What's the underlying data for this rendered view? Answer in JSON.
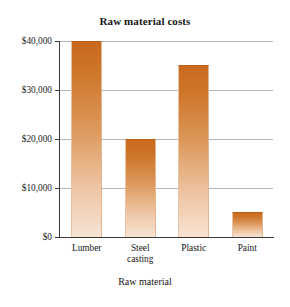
{
  "page": {
    "top_sliver_text": "·· ·             ·   ·"
  },
  "chart_data": {
    "type": "bar",
    "title": "Raw material costs",
    "xlabel": "Raw material",
    "ylabel": "",
    "categories": [
      "Lumber",
      "Steel casting",
      "Plastic",
      "Paint"
    ],
    "category_lines": [
      [
        "Lumber"
      ],
      [
        "Steel",
        "casting"
      ],
      [
        "Plastic"
      ],
      [
        "Paint"
      ]
    ],
    "values": [
      40000,
      20000,
      35000,
      5000
    ],
    "value_labels": [
      "$40,000",
      "$20,000",
      "$35,000",
      "$5,000"
    ],
    "ylim": [
      0,
      40000
    ],
    "ytick_values": [
      40000,
      30000,
      20000,
      10000,
      0
    ],
    "ytick_labels": [
      "$40,000",
      "$30,000",
      "$20,000",
      "$10,000",
      "$0"
    ],
    "grid": true,
    "grid_axis": "y",
    "legend": false,
    "bar_color_top": "#C96A1E",
    "bar_color_bottom": "#F7E3D3",
    "gridline_color": "#B5B5B5",
    "axis_color": "#3A3A3A",
    "background_color": "#FFFFFF"
  }
}
